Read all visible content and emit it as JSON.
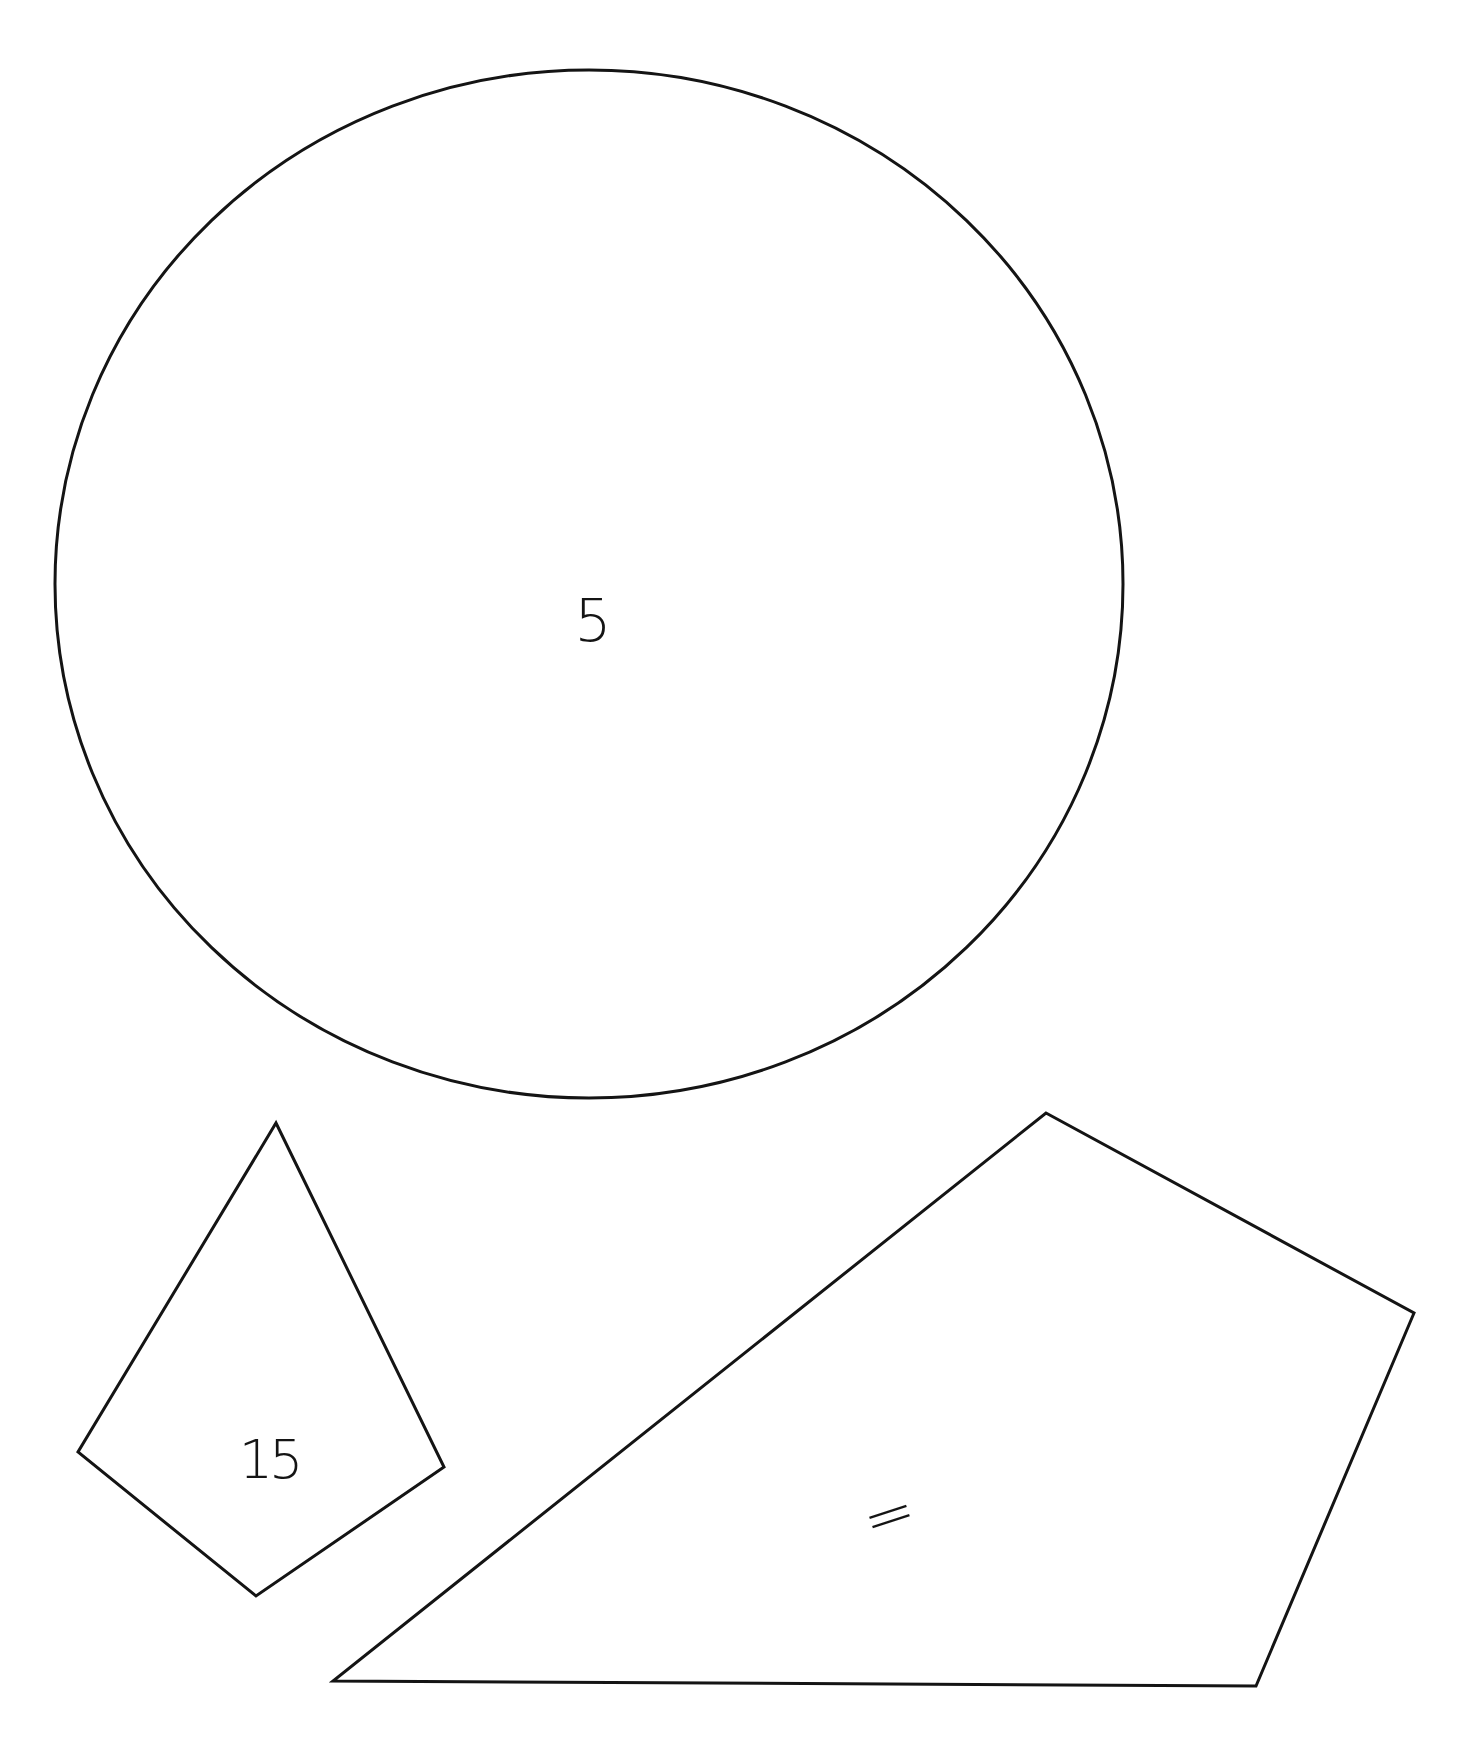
{
  "figure": {
    "background": "#ffffff",
    "stroke_color": "#141414",
    "shapes": [
      {
        "id": "circle",
        "type": "ellipse",
        "label": "5",
        "center": [
          589,
          584
        ],
        "rx": 534,
        "ry": 514,
        "label_pos": [
          593,
          621
        ]
      },
      {
        "id": "kite",
        "type": "quadrilateral",
        "label": "15",
        "points": [
          [
            276,
            1123
          ],
          [
            444,
            1467
          ],
          [
            256,
            1596
          ],
          [
            78,
            1452
          ]
        ],
        "label_pos": [
          269,
          1460
        ]
      },
      {
        "id": "large-quadrilateral",
        "type": "quadrilateral",
        "label": "=",
        "points": [
          [
            1046,
            1113
          ],
          [
            1414,
            1313
          ],
          [
            1256,
            1686
          ],
          [
            333,
            1681
          ]
        ],
        "label_pos": [
          889,
          1515
        ]
      }
    ]
  }
}
